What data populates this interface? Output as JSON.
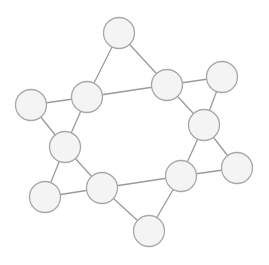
{
  "diagram": {
    "type": "undirected-graph",
    "style": {
      "background": "#ffffff",
      "node_fill": "#f4f4f4",
      "node_stroke": "#a8a8a8",
      "edge_stroke": "#9a9a9a",
      "node_radius": 15.5
    },
    "nodes": [
      {
        "id": "n1",
        "x": 119,
        "y": 33
      },
      {
        "id": "n2",
        "x": 87,
        "y": 97
      },
      {
        "id": "n3",
        "x": 31,
        "y": 105
      },
      {
        "id": "n4",
        "x": 167,
        "y": 85
      },
      {
        "id": "n5",
        "x": 222,
        "y": 77
      },
      {
        "id": "n6",
        "x": 204,
        "y": 125
      },
      {
        "id": "n7",
        "x": 65,
        "y": 147
      },
      {
        "id": "n8",
        "x": 45,
        "y": 197
      },
      {
        "id": "n9",
        "x": 102,
        "y": 188
      },
      {
        "id": "n10",
        "x": 181,
        "y": 176
      },
      {
        "id": "n11",
        "x": 237,
        "y": 168
      },
      {
        "id": "n12",
        "x": 149,
        "y": 231
      }
    ],
    "edges": [
      [
        "n1",
        "n2"
      ],
      [
        "n1",
        "n4"
      ],
      [
        "n2",
        "n4"
      ],
      [
        "n2",
        "n3"
      ],
      [
        "n2",
        "n7"
      ],
      [
        "n3",
        "n7"
      ],
      [
        "n4",
        "n5"
      ],
      [
        "n4",
        "n6"
      ],
      [
        "n5",
        "n6"
      ],
      [
        "n6",
        "n10"
      ],
      [
        "n6",
        "n11"
      ],
      [
        "n10",
        "n11"
      ],
      [
        "n7",
        "n8"
      ],
      [
        "n7",
        "n9"
      ],
      [
        "n8",
        "n9"
      ],
      [
        "n9",
        "n10"
      ],
      [
        "n9",
        "n12"
      ],
      [
        "n10",
        "n12"
      ]
    ]
  }
}
